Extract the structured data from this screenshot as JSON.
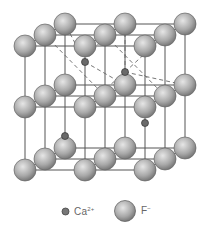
{
  "diagram": {
    "colors": {
      "line": "#555555",
      "dashed": "#666666",
      "f_ion_fill_center": "#e0e0e0",
      "f_ion_fill_edge": "#7a7a7a",
      "ca_ion_fill": "#6a6a6a",
      "background": "#ffffff"
    },
    "lattice": {
      "front_x": [
        25,
        85,
        145
      ],
      "layer_y": [
        46,
        107,
        170
      ],
      "depth_dx": 20,
      "depth_dy": -11,
      "f_radius": 11
    },
    "ca_ions": [
      {
        "x": 85,
        "y": 62
      },
      {
        "x": 125,
        "y": 72
      },
      {
        "x": 65,
        "y": 136
      },
      {
        "x": 145,
        "y": 123
      }
    ],
    "ca_radius": 3.5
  },
  "legend": {
    "ca": {
      "symbol": "Ca",
      "charge": "2+"
    },
    "f": {
      "symbol": "F",
      "charge": "−"
    }
  }
}
